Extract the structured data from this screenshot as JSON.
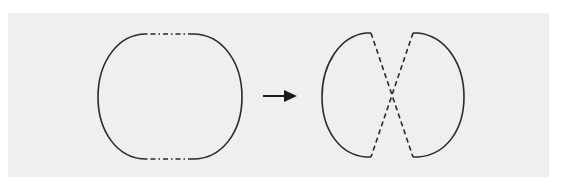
{
  "diagram": {
    "type": "transformation",
    "colors": {
      "background": "#ffffff",
      "panel": "#efefef",
      "stroke": "#2a2a2a"
    },
    "nodes": [
      {
        "id": "before-shape",
        "label": "",
        "description": "Rounded closed loop; left and right sides are solid arcs, top and bottom edges are dash-dot segments"
      },
      {
        "id": "arrow",
        "label": "",
        "description": "Right-pointing arrow indicating transformation"
      },
      {
        "id": "after-shape",
        "label": "",
        "description": "Two solid D-shaped arcs connected by two crossing dashed diagonal lines forming an X"
      }
    ]
  }
}
